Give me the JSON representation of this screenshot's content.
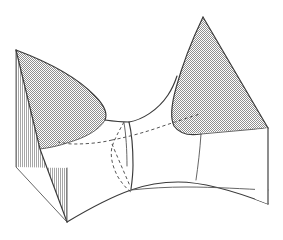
{
  "figure": {
    "kind": "line-art-diagram",
    "width": 283,
    "height": 240,
    "background_color": "#ffffff",
    "alt_text": "A three dimensional line drawing of a saddle shaped surface rising into two shaded peaks at left and right, with a vertically hatched cut face on the left side and dashed hidden contour lines crossing near the central saddle point.",
    "colors": {
      "outline": "#3a3a3a",
      "hidden_line": "#555555",
      "shade_fill": "#b0b0b0",
      "hatch_stroke": "#6e6e6e",
      "paper": "#ffffff"
    },
    "parts": [
      {
        "id": "left-lobe-shade",
        "label": "Left shaded lobe",
        "description": "Gray dotted-shaded upper face of the left rising wing",
        "fill": "#b0b0b0"
      },
      {
        "id": "right-lobe-shade",
        "label": "Right shaded lobe",
        "description": "Gray dotted-shaded upper face of the right rising wing",
        "fill": "#b0b0b0"
      },
      {
        "id": "left-cut-face",
        "label": "Left hatched cut face",
        "description": "Vertically hatched quadrilateral showing the sliced left edge of the surface",
        "hatch_direction": "vertical",
        "hatch_spacing_px": 2
      },
      {
        "id": "right-cut-face",
        "label": "Right cut face",
        "description": "Unshaded quadrilateral showing the sliced right edge of the surface"
      },
      {
        "id": "front-boundary",
        "label": "Front boundary curve",
        "description": "Downward curving front rim of the surface"
      },
      {
        "id": "saddle-valley",
        "label": "Central saddle valley",
        "description": "Concave dip between the two lobes where the surface passes through the saddle point"
      },
      {
        "id": "hidden-contours",
        "label": "Hidden contour lines",
        "description": "Dashed curves marking parts of the surface occluded from view",
        "style": "dashed"
      }
    ],
    "key_points": [
      {
        "name": "left-peak",
        "x": 16,
        "y": 50
      },
      {
        "name": "right-peak",
        "x": 203,
        "y": 17
      },
      {
        "name": "saddle-point",
        "x": 129,
        "y": 122
      },
      {
        "name": "front-low-point",
        "x": 67,
        "y": 222
      },
      {
        "name": "right-corner",
        "x": 268,
        "y": 128
      }
    ]
  }
}
